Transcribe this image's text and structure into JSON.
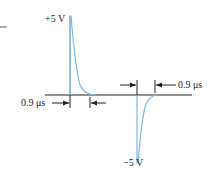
{
  "diagram": {
    "labels": {
      "positive_peak": "+5 V",
      "negative_peak": "−5 V",
      "left_width": "0.9 μs",
      "right_width": "0.9 μs"
    },
    "colors": {
      "waveform": "#7ab8e0",
      "axis": "#222222",
      "text": "#222222"
    }
  }
}
